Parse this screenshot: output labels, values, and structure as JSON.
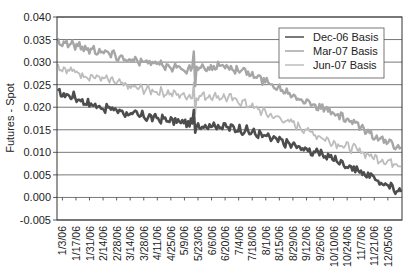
{
  "chart_data": {
    "type": "line",
    "title": "",
    "xlabel": "",
    "ylabel": "Futures - Spot",
    "ylim": [
      -0.005,
      0.04
    ],
    "yticks": [
      "0.040",
      "0.035",
      "0.030",
      "0.025",
      "0.020",
      "0.015",
      "0.010",
      "0.005",
      "0.000",
      "-0.005"
    ],
    "ytick_values": [
      0.04,
      0.035,
      0.03,
      0.025,
      0.02,
      0.015,
      0.01,
      0.005,
      0.0,
      -0.005
    ],
    "grid": true,
    "legend_position": "upper right (inside)",
    "categories": [
      "1/3/06",
      "1/17/06",
      "1/31/06",
      "2/14/06",
      "2/28/06",
      "3/14/06",
      "3/28/06",
      "4/11/06",
      "4/25/06",
      "5/9/06",
      "5/23/06",
      "6/6/06",
      "6/20/06",
      "7/4/06",
      "7/18/06",
      "8/1/06",
      "8/15/06",
      "8/29/06",
      "9/12/06",
      "9/26/06",
      "10/10/06",
      "10/24/06",
      "11/7/06",
      "11/21/06",
      "12/05/06"
    ],
    "series": [
      {
        "name": "Dec-06 Basis",
        "color": "#4d4d4d",
        "values": [
          0.023,
          0.0225,
          0.021,
          0.02,
          0.0195,
          0.0185,
          0.018,
          0.0175,
          0.017,
          0.0165,
          0.016,
          0.016,
          0.0155,
          0.015,
          0.014,
          0.013,
          0.012,
          0.011,
          0.01,
          0.009,
          0.0075,
          0.006,
          0.0045,
          0.0025,
          0.0015
        ]
      },
      {
        "name": "Mar-07 Basis",
        "color": "#a6a6a6",
        "values": [
          0.0345,
          0.034,
          0.033,
          0.0325,
          0.0315,
          0.0305,
          0.03,
          0.0295,
          0.029,
          0.0285,
          0.0285,
          0.029,
          0.029,
          0.028,
          0.0265,
          0.025,
          0.0235,
          0.022,
          0.0205,
          0.019,
          0.0175,
          0.016,
          0.014,
          0.012,
          0.011
        ]
      },
      {
        "name": "Jun-07 Basis",
        "color": "#bdbdbd",
        "values": [
          0.029,
          0.028,
          0.027,
          0.0265,
          0.0255,
          0.0245,
          0.024,
          0.0235,
          0.023,
          0.0225,
          0.0225,
          0.0225,
          0.022,
          0.021,
          0.0195,
          0.018,
          0.017,
          0.0155,
          0.014,
          0.0125,
          0.0115,
          0.0105,
          0.009,
          0.008,
          0.0075
        ]
      }
    ],
    "annotations": [
      "spike near 5/23/06 in all series"
    ]
  },
  "legend": {
    "items": [
      {
        "label": "Dec-06 Basis",
        "color": "#4d4d4d"
      },
      {
        "label": "Mar-07 Basis",
        "color": "#a6a6a6"
      },
      {
        "label": "Jun-07 Basis",
        "color": "#bdbdbd"
      }
    ]
  }
}
